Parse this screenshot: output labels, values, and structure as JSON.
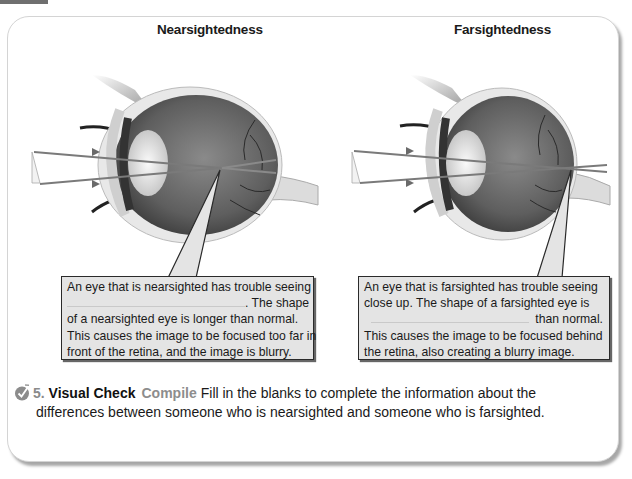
{
  "page": {
    "headings": {
      "nearsighted": "Nearsightedness",
      "farsighted": "Farsightedness"
    },
    "callouts": {
      "nearsighted": {
        "line1": "An eye that is nearsighted has trouble seeing",
        "line2_after_blank": ". The shape",
        "line3": "of a nearsighted eye is longer than normal.",
        "line4": "This causes the image to be focused too far in",
        "line5": "front of the retina, and the image is blurry."
      },
      "farsighted": {
        "line1": "An eye that is farsighted has trouble seeing",
        "line2": "close up. The shape of a farsighted eye is",
        "line3_after_blank": "than normal.",
        "line4": "This causes the image to be focused behind",
        "line5": "the retina, also creating a blurry image."
      }
    },
    "question": {
      "icon": "checkmark-circle-icon",
      "number": "5.",
      "title": "Visual Check",
      "verb": "Compile",
      "text_line1": "Fill in the blanks to complete the information about the",
      "text_line2": "differences between someone who is nearsighted and someone who is farsighted."
    },
    "colors": {
      "callout_bg": "#e4e4e4",
      "ray": "#7a7a7a",
      "question_number": "#8a8a8a"
    }
  }
}
